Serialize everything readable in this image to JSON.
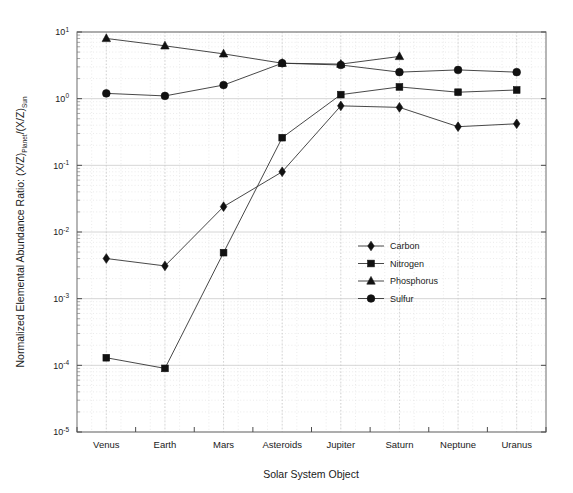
{
  "chart_data": {
    "type": "line",
    "title": "",
    "xlabel": "Solar System Object",
    "ylabel": "Normalized Elemental Abundance Ratio: (X/Z)_Planet/(X/Z)_Sun",
    "ylabel_parts": {
      "lead": "Normalized Elemental Abundance Ratio: (X/Z)",
      "sub1": "Planet",
      "mid": "/(X/Z)",
      "sub2": "Sun"
    },
    "categories": [
      "Venus",
      "Earth",
      "Mars",
      "Asteroids",
      "Jupiter",
      "Saturn",
      "Neptune",
      "Uranus"
    ],
    "yscale": "log",
    "ylim": [
      1e-05,
      10
    ],
    "ytick_labels": [
      "10-5",
      "10-4",
      "10-3",
      "10-2",
      "10-1",
      "100",
      "101"
    ],
    "ytick_bases": [
      "10",
      "10",
      "10",
      "10",
      "10",
      "10",
      "10"
    ],
    "ytick_exponents": [
      "-5",
      "-4",
      "-3",
      "-2",
      "-1",
      "0",
      "1"
    ],
    "grid": true,
    "grid_minor": true,
    "legend_position": "center",
    "series": [
      {
        "name": "Carbon",
        "marker": "diamond",
        "values": [
          0.004,
          0.0031,
          0.024,
          0.08,
          0.78,
          0.74,
          0.38,
          0.42
        ]
      },
      {
        "name": "Nitrogen",
        "marker": "square",
        "values": [
          0.00013,
          9e-05,
          0.0049,
          0.26,
          1.15,
          1.5,
          1.25,
          1.35
        ]
      },
      {
        "name": "Phosphorus",
        "marker": "triangle",
        "values": [
          8.0,
          6.2,
          4.7,
          3.4,
          3.3,
          4.3,
          null,
          null
        ]
      },
      {
        "name": "Sulfur",
        "marker": "circle",
        "values": [
          1.2,
          1.1,
          1.6,
          3.4,
          3.2,
          2.5,
          2.7,
          2.5
        ]
      }
    ],
    "colors": {
      "line": "#333333",
      "marker": "#111111",
      "grid": "#cccccc",
      "grid_minor": "#dddddd",
      "axis": "#666666",
      "background": "#ffffff"
    }
  },
  "legend": {
    "items": [
      {
        "label": "Carbon",
        "marker": "diamond"
      },
      {
        "label": "Nitrogen",
        "marker": "square"
      },
      {
        "label": "Phosphorus",
        "marker": "triangle"
      },
      {
        "label": "Sulfur",
        "marker": "circle"
      }
    ]
  }
}
